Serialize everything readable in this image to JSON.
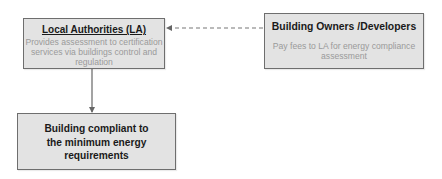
{
  "diagram": {
    "nodes": {
      "local_authorities": {
        "title": "Local Authorities (LA)",
        "description": "Provides assessment to certification services via buildings control and regulation"
      },
      "building_owners": {
        "title": "Building Owners /Developers",
        "description": "Pay fees to LA for energy compliance assessment"
      },
      "compliant_building": {
        "title": "Building  compliant to the minimum energy requirements"
      }
    },
    "edges": [
      {
        "from": "building_owners",
        "to": "local_authorities",
        "style": "dashed"
      },
      {
        "from": "local_authorities",
        "to": "compliant_building",
        "style": "solid"
      }
    ],
    "colors": {
      "box_fill": "#e3e3e3",
      "box_border": "#6e6e6e",
      "title_text": "#1a1a1a",
      "description_text": "#9a9a9a",
      "connector": "#666666"
    }
  }
}
